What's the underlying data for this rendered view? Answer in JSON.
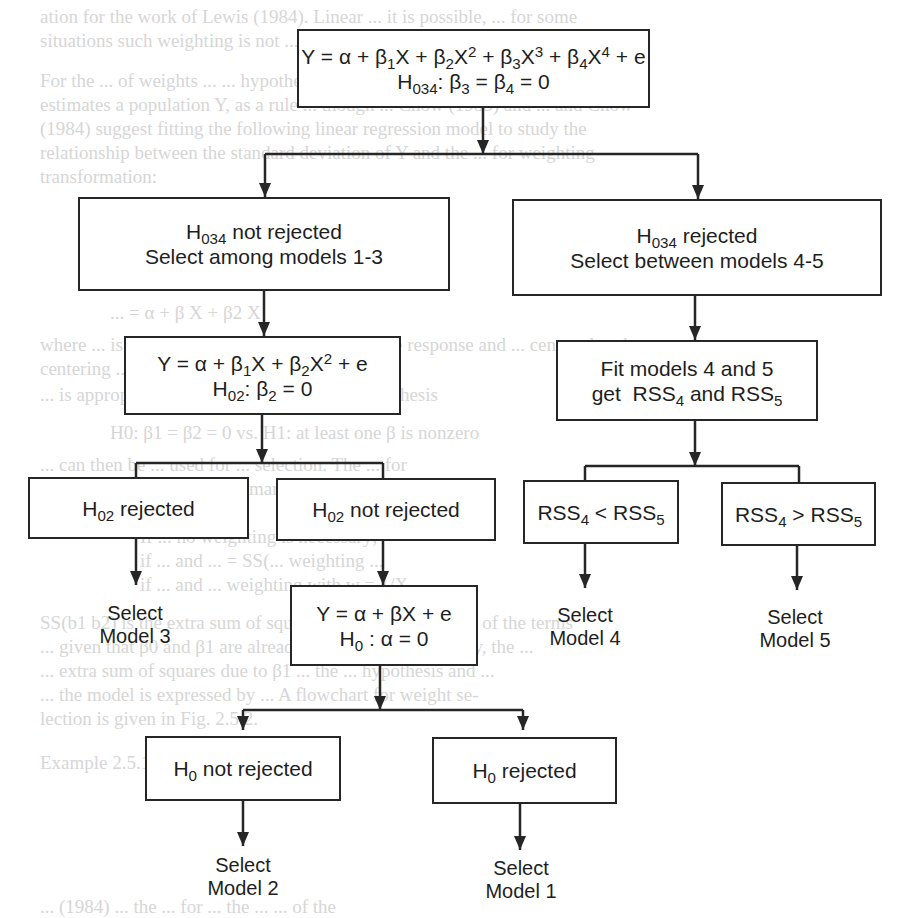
{
  "flowchart": {
    "root": {
      "model": "Y = α + β1X + β2X2 + β3X3 + β4X4 + e",
      "hypothesis": "H034: β3 = β4 = 0"
    },
    "h034_not_rejected": {
      "line1": "H034 not rejected",
      "line2": "Select  among models 1-3"
    },
    "h034_rejected": {
      "line1": "H034 rejected",
      "line2": "Select between models 4-5"
    },
    "quadratic": {
      "model": "Y = α + β1X + β2X2 + e",
      "hypothesis": "H02: β2 = 0"
    },
    "fit_models": {
      "line1": "Fit  models 4  and  5",
      "line2": "get  RSS4 and RSS5"
    },
    "h02_rejected": "H02 rejected",
    "h02_not_rejected": "H02 not rejected",
    "rss_less": "RSS4 < RSS5",
    "rss_greater": "RSS4 > RSS5",
    "linear": {
      "model": "Y = α + βX + e",
      "hypothesis": "H0 : α = 0"
    },
    "h0_not_rejected": "H0 not rejected",
    "h0_rejected": "H0 rejected",
    "outcomes": {
      "model3": {
        "line1": "Select",
        "line2": "Model 3"
      },
      "model4": {
        "line1": "Select",
        "line2": "Model 4"
      },
      "model5": {
        "line1": "Select",
        "line2": "Model 5"
      },
      "model2": {
        "line1": "Select",
        "line2": "Model 2"
      },
      "model1": {
        "line1": "Select",
        "line2": "Model 1"
      }
    }
  },
  "background_text": [
    "ation for the work of Lewis (1984). Linear ... it is possible, ... for some",
    "situations such weighting is not ... rule in practice",
    "For the ... of weights ... ... hypotheses of ... rule ... reason f",
    "estimates a population Y, as a rule ... though ... Chow (1983) and ... and Chow",
    "(1984) suggest fitting the following linear regression model to study the",
    "relationship between the standard deviation of Y and the ... for weighting",
    "transformation:",
    "... = α + β X + β2 X",
    "where ... is the sample standard deviation of the response and ... centered rank",
    "centering ...",
    "... is appropriate for testing the following hypothesis",
    "H0: β1 = β2 = 0   vs. H1: at least one β is nonzero",
    "... can then be ... used for ... selection. The ... for",
    "which selection can be summarized as follows:",
    "If ... no weighting is necessary;",
    "if ... and ... = SS(... weighting ...",
    "if ... and ... weighting with w = 1/X",
    "SS(b1 b2) is the extra sum of squares due to the inclusion of the terms",
    "... given that β0 and β1 are already in the model. Similarly, the ...",
    "... extra sum of squares due to β1 ... the ... hypothesis and ...",
    "... the model is expressed by ... A flowchart for weight se-",
    "lection is given in Fig. 2.5.2.",
    "Example 2.5.1",
    "... (1984) ... the ... for ... the ... ... of the"
  ]
}
